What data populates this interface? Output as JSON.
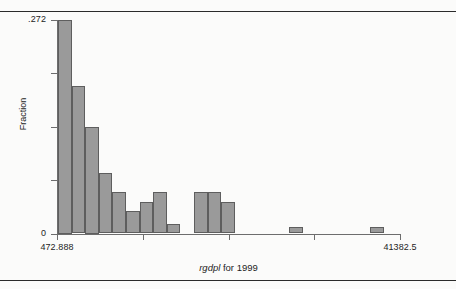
{
  "figure": {
    "kind": "histogram",
    "y_axis_title": "Fraction",
    "x_axis_title_variable": "rgdpl",
    "x_axis_title_rest": " for 1999",
    "bar_fill_color": "#9a9a9a",
    "bar_edge_color": "#5e5e5e",
    "axis_color": "#6d6d6d",
    "rule_color": "#2b2b2b"
  },
  "chart_data": {
    "type": "bar",
    "title": "",
    "subtitle": "",
    "xlabel": "rgdpl for 1999",
    "ylabel": "Fraction",
    "grid": false,
    "legend": null,
    "ylim": [
      0,
      0.272
    ],
    "xlim": [
      472.888,
      41382.5
    ],
    "y_tick_labels": [
      ".272",
      "0"
    ],
    "y_tick_values": [
      0.272,
      0
    ],
    "y_minor_tick_values": [
      0.068,
      0.136,
      0.204
    ],
    "x_tick_labels": [
      "472.888",
      "",
      "",
      "",
      "41382.5"
    ],
    "x_tick_values": [
      472.888,
      10700.3,
      20927.7,
      31155.1,
      41382.5
    ],
    "bin_count": 15,
    "bins": [
      {
        "index": 1,
        "x_left": 472.888,
        "x_right": 3200.5,
        "value": 0.272
      },
      {
        "index": 2,
        "x_left": 3200.5,
        "x_right": 5928.1,
        "value": 0.188
      },
      {
        "index": 3,
        "x_left": 5928.1,
        "x_right": 8655.7,
        "value": 0.136
      },
      {
        "index": 4,
        "x_left": 8655.7,
        "x_right": 11383.3,
        "value": 0.077
      },
      {
        "index": 5,
        "x_left": 11383.3,
        "x_right": 14110.9,
        "value": 0.053
      },
      {
        "index": 6,
        "x_left": 14110.9,
        "x_right": 16838.5,
        "value": 0.029
      },
      {
        "index": 7,
        "x_left": 16838.5,
        "x_right": 19566.1,
        "value": 0.04
      },
      {
        "index": 8,
        "x_left": 19566.1,
        "x_right": 22293.7,
        "value": 0.053
      },
      {
        "index": 9,
        "x_left": 22293.7,
        "x_right": 25021.3,
        "value": 0.012
      },
      {
        "index": 10,
        "x_left": 25021.3,
        "x_right": 27748.9,
        "value": 0.0
      },
      {
        "index": 11,
        "x_left": 27748.9,
        "x_right": 30476.5,
        "value": 0.053
      },
      {
        "index": 12,
        "x_left": 30476.5,
        "x_right": 33204.1,
        "value": 0.053
      },
      {
        "index": 13,
        "x_left": 33204.1,
        "x_right": 35931.7,
        "value": 0.04
      },
      {
        "index": 14,
        "x_left": 35931.7,
        "x_right": 38659.3,
        "value": 0.0
      },
      {
        "index": 15,
        "x_left": 38659.3,
        "x_right": 41386.9,
        "value": 0.0
      }
    ],
    "drawn_bars": [
      {
        "id": "bar-1",
        "value": 0.272,
        "px_left": 58.0,
        "px_width": 13.6
      },
      {
        "id": "bar-2",
        "value": 0.188,
        "px_left": 71.6,
        "px_width": 13.6
      },
      {
        "id": "bar-3",
        "value": 0.136,
        "px_left": 85.2,
        "px_width": 13.6
      },
      {
        "id": "bar-4",
        "value": 0.077,
        "px_left": 98.8,
        "px_width": 13.6
      },
      {
        "id": "bar-5",
        "value": 0.053,
        "px_left": 112.4,
        "px_width": 13.6
      },
      {
        "id": "bar-6",
        "value": 0.029,
        "px_left": 126.0,
        "px_width": 13.6
      },
      {
        "id": "bar-7",
        "value": 0.04,
        "px_left": 139.6,
        "px_width": 13.6
      },
      {
        "id": "bar-8",
        "value": 0.053,
        "px_left": 153.2,
        "px_width": 13.6
      },
      {
        "id": "bar-9",
        "value": 0.012,
        "px_left": 166.8,
        "px_width": 13.6
      },
      {
        "id": "bar-11",
        "value": 0.053,
        "px_left": 194.0,
        "px_width": 13.6
      },
      {
        "id": "bar-12",
        "value": 0.053,
        "px_left": 207.6,
        "px_width": 13.6
      },
      {
        "id": "bar-13",
        "value": 0.04,
        "px_left": 221.2,
        "px_width": 13.6
      },
      {
        "id": "bar-15",
        "value": 0.008,
        "px_left": 289.0,
        "px_width": 13.6
      },
      {
        "id": "bar-18",
        "value": 0.008,
        "px_left": 370.0,
        "px_width": 13.6
      }
    ]
  }
}
